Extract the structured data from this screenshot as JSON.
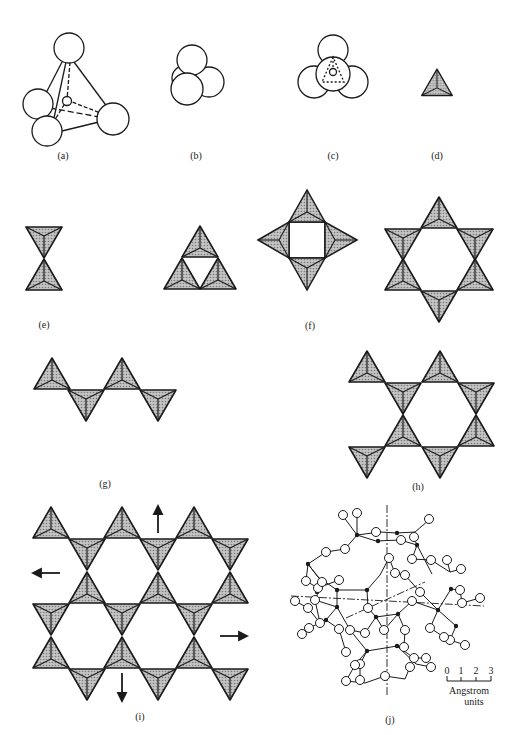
{
  "figure": {
    "panels": [
      {
        "id": "a",
        "label": "(a)",
        "description": "Four large oxygen spheres at tetrahedron corners around small central silicon atom"
      },
      {
        "id": "b",
        "label": "(b)",
        "description": "Close-packed SiO4 tetrahedron of spheres"
      },
      {
        "id": "c",
        "label": "(c)",
        "description": "Top view of tetrahedron with dashed inner edges"
      },
      {
        "id": "d",
        "label": "(d)",
        "description": "Shaded tetrahedron symbol"
      },
      {
        "id": "e",
        "label": "(e)",
        "description": "Two tetrahedra sharing a corner"
      },
      {
        "id": "f",
        "label": "(f)",
        "description": "Rings of three, four and six tetrahedra"
      },
      {
        "id": "g",
        "label": "(g)",
        "description": "Single chain of tetrahedra"
      },
      {
        "id": "h",
        "label": "(h)",
        "description": "Double chain of tetrahedra"
      },
      {
        "id": "i",
        "label": "(i)",
        "description": "Sheet of tetrahedra with extension arrows"
      },
      {
        "id": "j",
        "label": "(j)",
        "description": "Three-dimensional framework cage with symmetry axes"
      }
    ],
    "scale_bar": {
      "ticks": [
        "0",
        "1",
        "2",
        "3"
      ],
      "unit_line1": "Angstrom",
      "unit_line2": "units"
    },
    "colors": {
      "stroke": "#1a1a1a",
      "fill": "#a8a8a8",
      "background": "#ffffff"
    }
  }
}
